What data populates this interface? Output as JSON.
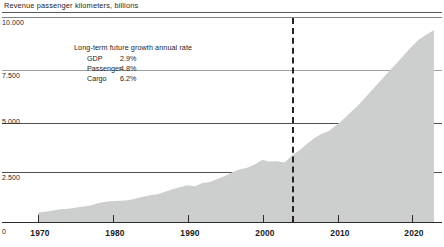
{
  "chart_data": {
    "type": "area",
    "title": "Revenue passenger kilometers, billions",
    "xlabel": "",
    "ylabel": "",
    "origin_label": "0",
    "ylim": [
      0,
      10000
    ],
    "xlim": [
      1969,
      2024
    ],
    "grid": true,
    "yticks": [
      10000,
      7500,
      5000,
      2500
    ],
    "ytick_labels": [
      "10.000",
      "7.500",
      "5.000",
      "2.500"
    ],
    "xticks": [
      1970,
      1980,
      1990,
      2000,
      2010,
      2020
    ],
    "xtick_labels": [
      "1970",
      "1980",
      "1990",
      "2000",
      "2010",
      "2020"
    ],
    "series_name": "Revenue passenger kilometers",
    "fill_color": "#cdcfce",
    "forecast_divider_year": 2004,
    "x": [
      1970,
      1971,
      1972,
      1973,
      1974,
      1975,
      1976,
      1977,
      1978,
      1979,
      1980,
      1981,
      1982,
      1983,
      1984,
      1985,
      1986,
      1987,
      1988,
      1989,
      1990,
      1991,
      1992,
      1993,
      1994,
      1995,
      1996,
      1997,
      1998,
      1999,
      2000,
      2001,
      2002,
      2003,
      2004,
      2005,
      2006,
      2007,
      2008,
      2009,
      2010,
      2011,
      2012,
      2013,
      2014,
      2015,
      2016,
      2017,
      2018,
      2019,
      2020,
      2021,
      2022,
      2023
    ],
    "values": [
      460,
      500,
      560,
      620,
      650,
      690,
      760,
      810,
      910,
      990,
      1030,
      1040,
      1060,
      1130,
      1230,
      1310,
      1350,
      1480,
      1600,
      1700,
      1790,
      1740,
      1900,
      1950,
      2100,
      2250,
      2430,
      2570,
      2650,
      2800,
      3020,
      2950,
      2960,
      2900,
      3250,
      3500,
      3800,
      4100,
      4300,
      4450,
      4750,
      5050,
      5400,
      5750,
      6150,
      6550,
      6950,
      7350,
      7750,
      8150,
      8550,
      8900,
      9150,
      9350
    ],
    "annotation": {
      "heading": "Long-term future growth annual rate",
      "rows": [
        {
          "name": "GDP",
          "value": "2.9%"
        },
        {
          "name": "Passenger",
          "value": "4.8%"
        },
        {
          "name": "Cargo",
          "value": "6.2%"
        }
      ]
    }
  }
}
